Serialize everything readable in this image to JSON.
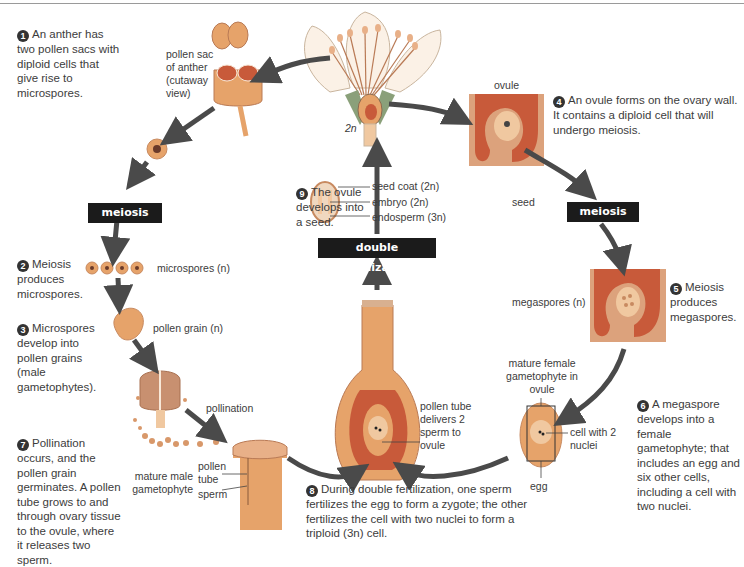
{
  "diagram": {
    "steps": [
      {
        "num": "1",
        "text": "An anther has two pollen sacs with diploid cells that give rise to microspores."
      },
      {
        "num": "2",
        "text": "Meiosis produces microspores."
      },
      {
        "num": "3",
        "text": "Microspores develop into pollen grains (male gametophytes)."
      },
      {
        "num": "4",
        "text": "An ovule forms on the ovary wall. It contains a diploid cell that will undergo meiosis."
      },
      {
        "num": "5",
        "text": "Meiosis produces megaspores."
      },
      {
        "num": "6",
        "text": "A megaspore develops into a female gametophyte; that includes an egg and six other cells, including a cell with two nuclei."
      },
      {
        "num": "7",
        "text": "Pollination occurs, and the pollen grain germinates. A pollen tube grows to and through ovary tissue to the ovule, where it releases two sperm."
      },
      {
        "num": "8",
        "text": "During double fertilization, one sperm fertilizes the egg to form a zygote; the other fertilizes the cell with two nuclei to form a triploid (3n) cell."
      },
      {
        "num": "9",
        "text": "The ovule develops into a seed."
      }
    ],
    "process_boxes": {
      "meiosis_left": "meiosis",
      "meiosis_right": "meiosis",
      "double_fertilization": "double fertilization"
    },
    "labels": {
      "pollen_sac": "pollen sac of anther (cutaway view)",
      "flower_ploidy": "2n",
      "ovule": "ovule",
      "microspores": "microspores (n)",
      "pollen_grain": "pollen grain (n)",
      "pollination": "pollination",
      "pollen_tube": "pollen tube",
      "sperm": "sperm",
      "mature_male_gametophyte": "mature male gametophyte",
      "seed_coat": "seed coat (2n)",
      "embryo": "embryo (2n)",
      "endosperm": "endosperm (3n)",
      "seed": "seed",
      "megaspores": "megaspores (n)",
      "mature_female_gametophyte": "mature female gametophyte in ovule",
      "cell_with_2_nuclei": "cell with 2 nuclei",
      "egg": "egg",
      "pollen_tube_delivers": "pollen tube delivers 2 sperm to ovule"
    },
    "colors": {
      "arrow": "#4a4a4a",
      "tissue_orange": "#e6a36a",
      "tissue_dark": "#c85a3a",
      "ovule_bg": "#dca27c",
      "petal": "#fbf1e6",
      "process_box": "#1b1b1b"
    }
  }
}
